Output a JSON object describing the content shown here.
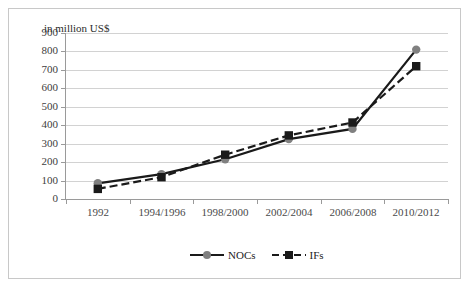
{
  "chart_data": {
    "type": "line",
    "title": "in million US$",
    "xlabel": "",
    "ylabel": "",
    "ylim": [
      0,
      900
    ],
    "ytick_step": 100,
    "yticks": [
      900,
      800,
      700,
      600,
      500,
      400,
      300,
      200,
      100,
      0
    ],
    "grid": true,
    "legend_position": "bottom",
    "categories": [
      "1992",
      "1994/1996",
      "1998/2000",
      "2002/2004",
      "2006/2008",
      "2010/2012"
    ],
    "series": [
      {
        "name": "NOCs",
        "values": [
          85,
          135,
          215,
          325,
          380,
          810
        ],
        "line_style": "solid",
        "line_color": "#1a1a1a",
        "marker": "circle",
        "marker_color": "#808080"
      },
      {
        "name": "IFs",
        "values": [
          55,
          118,
          240,
          345,
          415,
          720
        ],
        "line_style": "dashed",
        "line_color": "#1a1a1a",
        "marker": "square",
        "marker_color": "#1a1a1a"
      }
    ]
  },
  "axis": {
    "y_tick_labels": [
      "900",
      "800",
      "700",
      "600",
      "500",
      "400",
      "300",
      "200",
      "100",
      "0"
    ],
    "x_tick_labels": [
      "1992",
      "1994/1996",
      "1998/2000",
      "2002/2004",
      "2006/2008",
      "2010/2012"
    ],
    "title": "in million US$"
  },
  "legend": {
    "items": [
      {
        "label": "NOCs",
        "icon": "line-circle-marker-icon"
      },
      {
        "label": "IFs",
        "icon": "dashed-line-square-marker-icon"
      }
    ]
  },
  "colors": {
    "grid": "#d2d2d2",
    "axis": "#9a9a9a",
    "series_nocs_marker": "#808080",
    "series_ifs_marker": "#1a1a1a",
    "line": "#1a1a1a",
    "frame": "#c8c8c8",
    "text": "#404040"
  }
}
